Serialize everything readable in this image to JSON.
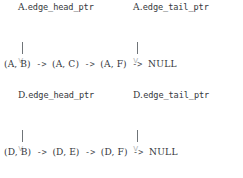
{
  "diagram": {
    "text_color": "#35383c",
    "pipe_color": "#6f7478",
    "arrowhead_color": "#b9bdc0",
    "background": "#ffffff",
    "arrow_symbol": "->",
    "pipe_symbol": "|",
    "arrowhead_symbol": "v",
    "blocks": [
      {
        "id": "vertex-a",
        "owner": "A.",
        "head_pointer_label": "edge_head_ptr",
        "tail_pointer_label": "edge_tail_ptr",
        "nodes": [
          "(A, B)",
          "(A, C)",
          "(A, F)"
        ],
        "terminator": "NULL"
      },
      {
        "id": "vertex-d",
        "owner": "D.",
        "head_pointer_label": "edge_head_ptr",
        "tail_pointer_label": "edge_tail_ptr",
        "nodes": [
          "(D, B)",
          "(D, E)",
          "(D, F)"
        ],
        "terminator": "NULL"
      }
    ]
  }
}
